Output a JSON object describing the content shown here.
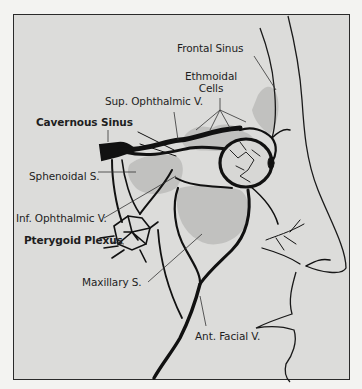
{
  "figure": {
    "type": "anatomical-illustration",
    "labels": {
      "frontal_sinus": "Frontal Sinus",
      "ethmoidal_cells_1": "Ethmoidal",
      "ethmoidal_cells_2": "Cells",
      "sup_ophthalmic_v": "Sup. Ophthalmic V.",
      "cavernous_sinus": "Cavernous Sinus",
      "sphenoidal_s": "Sphenoidal S.",
      "inf_ophthalmic_v": "Inf. Ophthalmic V.",
      "pterygoid_plexus": "Pterygoid Plexus",
      "maxillary_s": "Maxillary S.",
      "ant_facial_v": "Ant. Facial V."
    },
    "colors": {
      "background": "#dcdcda",
      "page": "#f3f3f1",
      "vein": "#111111",
      "sinus_shading": "#b9b9b7",
      "outline": "#2a2a2a"
    }
  }
}
